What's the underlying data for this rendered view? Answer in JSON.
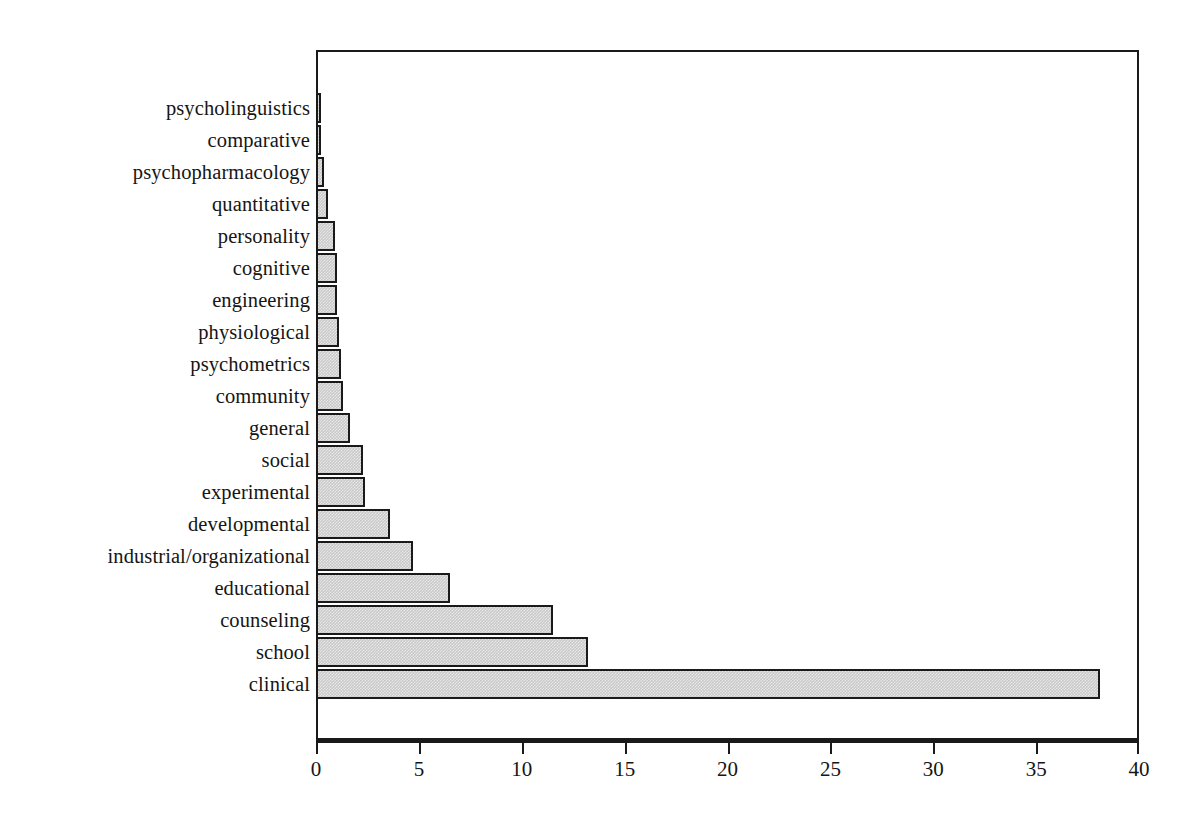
{
  "chart_data": {
    "type": "bar",
    "orientation": "horizontal",
    "title": "",
    "subtitle": "",
    "xlabel": "",
    "ylabel": "",
    "xlim": [
      0,
      40
    ],
    "ylim": null,
    "grid": false,
    "legend": null,
    "xticks": [
      0,
      5,
      10,
      15,
      20,
      25,
      30,
      35,
      40
    ],
    "xtick_labels": [
      "0",
      "5",
      "10",
      "15",
      "20",
      "25",
      "30",
      "35",
      "40"
    ],
    "categories": [
      "psycholinguistics",
      "comparative",
      "psychopharmacology",
      "quantitative",
      "personality",
      "cognitive",
      "engineering",
      "physiological",
      "psychometrics",
      "community",
      "general",
      "social",
      "experimental",
      "developmental",
      "industrial/organizational",
      "educational",
      "counseling",
      "school",
      "clinical"
    ],
    "values": [
      0.25,
      0.25,
      0.4,
      0.6,
      0.9,
      1.0,
      1.0,
      1.1,
      1.2,
      1.3,
      1.65,
      2.3,
      2.4,
      3.6,
      4.7,
      6.5,
      11.5,
      13.2,
      38.1
    ],
    "bar_fill_color": "#c9c9c9",
    "bar_edge_color": "#1a1a1a",
    "axis_color": "#1a1a1a",
    "background_color": "#ffffff"
  }
}
